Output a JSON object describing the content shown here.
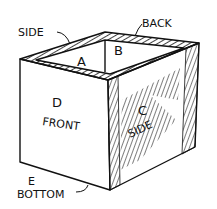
{
  "diagram": {
    "labels": {
      "side_top": "SIDE",
      "back": "BACK",
      "a": "A",
      "b": "B",
      "d": "D",
      "front": "FRONT",
      "c": "C",
      "side_right": "SIDE",
      "e": "E",
      "bottom": "BOTTOM"
    },
    "colors": {
      "ink": "#111111",
      "paper": "#ffffff"
    }
  }
}
